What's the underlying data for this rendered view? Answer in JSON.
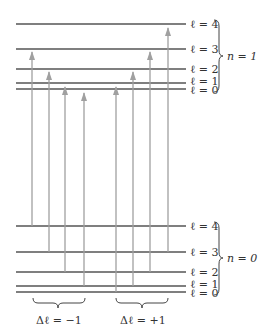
{
  "colors": {
    "level_line": "#555555",
    "arrow": "#a0a0a0",
    "text": "#333333",
    "brace": "#444444"
  },
  "upper_band": {
    "label": "n = 1",
    "levels": [
      {
        "label": "ℓ = 4",
        "y": 24
      },
      {
        "label": "ℓ = 3",
        "y": 49
      },
      {
        "label": "ℓ = 2",
        "y": 69
      },
      {
        "label": "ℓ = 1",
        "y": 83
      },
      {
        "label": "ℓ = 0",
        "y": 89
      }
    ]
  },
  "lower_band": {
    "label": "n = 0",
    "levels": [
      {
        "label": "ℓ = 4",
        "y": 226
      },
      {
        "label": "ℓ = 3",
        "y": 252
      },
      {
        "label": "ℓ = 2",
        "y": 272
      },
      {
        "label": "ℓ = 1",
        "y": 286
      },
      {
        "label": "ℓ = 0",
        "y": 292
      }
    ]
  },
  "groups": [
    {
      "label": "Δℓ = −1",
      "transitions": [
        {
          "x": 32,
          "from": "ℓ=4",
          "to": "ℓ=3",
          "y1": 226,
          "y2": 49
        },
        {
          "x": 49,
          "from": "ℓ=3",
          "to": "ℓ=2",
          "y1": 252,
          "y2": 69
        },
        {
          "x": 65,
          "from": "ℓ=2",
          "to": "ℓ=1",
          "y1": 272,
          "y2": 83
        },
        {
          "x": 84,
          "from": "ℓ=1",
          "to": "ℓ=0",
          "y1": 286,
          "y2": 89
        }
      ]
    },
    {
      "label": "Δℓ = +1",
      "transitions": [
        {
          "x": 116,
          "from": "ℓ=0",
          "to": "ℓ=1",
          "y1": 292,
          "y2": 83
        },
        {
          "x": 133,
          "from": "ℓ=1",
          "to": "ℓ=2",
          "y1": 286,
          "y2": 69
        },
        {
          "x": 150,
          "from": "ℓ=2",
          "to": "ℓ=3",
          "y1": 272,
          "y2": 49
        },
        {
          "x": 168,
          "from": "ℓ=3",
          "to": "ℓ=4",
          "y1": 252,
          "y2": 24
        }
      ]
    }
  ]
}
